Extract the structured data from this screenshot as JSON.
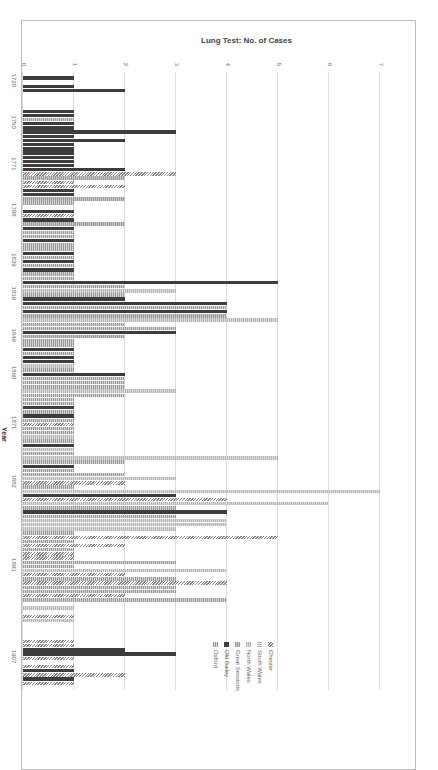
{
  "chart_data": {
    "type": "bar",
    "orientation_on_page": "rotated 90deg clockwise",
    "title": "",
    "xlabel": "Year",
    "ylabel": "Lung Test: No. of Cases",
    "ylim": [
      0,
      7
    ],
    "yticks": [
      0,
      1,
      2,
      3,
      4,
      5,
      6,
      7
    ],
    "grid": true,
    "legend_position": "top-right (rotated)",
    "xtick_labels": [
      "1720",
      "1750",
      "1771",
      "1798",
      "1829",
      "1839",
      "1849",
      "1860",
      "1871",
      "1882",
      "1893",
      "1907"
    ],
    "series_names": [
      "Chester",
      "South Wales",
      "North Wales",
      "Great Sessions",
      "Old Bailey",
      "Oxford"
    ],
    "series_styles": [
      "diagonal-hatch",
      "light-vertical",
      "light-dotted",
      "gray-dotted",
      "solid-dark",
      "gray-dotted-light"
    ],
    "bars": [
      {
        "pos": 1,
        "series": 4,
        "value": 1
      },
      {
        "pos": 3,
        "series": 4,
        "value": 1
      },
      {
        "pos": 4,
        "series": 4,
        "value": 2
      },
      {
        "pos": 9,
        "series": 4,
        "value": 1
      },
      {
        "pos": 10,
        "series": 4,
        "value": 1
      },
      {
        "pos": 11,
        "series": 5,
        "value": 1
      },
      {
        "pos": 12,
        "series": 4,
        "value": 1
      },
      {
        "pos": 13,
        "series": 4,
        "value": 1
      },
      {
        "pos": 14,
        "series": 4,
        "value": 3
      },
      {
        "pos": 15,
        "series": 4,
        "value": 1
      },
      {
        "pos": 16,
        "series": 4,
        "value": 2
      },
      {
        "pos": 17,
        "series": 4,
        "value": 1
      },
      {
        "pos": 18,
        "series": 4,
        "value": 1
      },
      {
        "pos": 19,
        "series": 4,
        "value": 1
      },
      {
        "pos": 20,
        "series": 4,
        "value": 1
      },
      {
        "pos": 21,
        "series": 4,
        "value": 1
      },
      {
        "pos": 22,
        "series": 4,
        "value": 1
      },
      {
        "pos": 23,
        "series": 4,
        "value": 2
      },
      {
        "pos": 24,
        "series": 0,
        "value": 3
      },
      {
        "pos": 25,
        "series": 3,
        "value": 2
      },
      {
        "pos": 26,
        "series": 0,
        "value": 1
      },
      {
        "pos": 27,
        "series": 0,
        "value": 2
      },
      {
        "pos": 28,
        "series": 4,
        "value": 1
      },
      {
        "pos": 29,
        "series": 4,
        "value": 1
      },
      {
        "pos": 30,
        "series": 3,
        "value": 2
      },
      {
        "pos": 31,
        "series": 5,
        "value": 1
      },
      {
        "pos": 33,
        "series": 4,
        "value": 1
      },
      {
        "pos": 34,
        "series": 0,
        "value": 1
      },
      {
        "pos": 35,
        "series": 4,
        "value": 1
      },
      {
        "pos": 36,
        "series": 3,
        "value": 2
      },
      {
        "pos": 37,
        "series": 4,
        "value": 1
      },
      {
        "pos": 38,
        "series": 5,
        "value": 1
      },
      {
        "pos": 39,
        "series": 5,
        "value": 1
      },
      {
        "pos": 40,
        "series": 4,
        "value": 1
      },
      {
        "pos": 41,
        "series": 5,
        "value": 1
      },
      {
        "pos": 42,
        "series": 5,
        "value": 1
      },
      {
        "pos": 43,
        "series": 4,
        "value": 1
      },
      {
        "pos": 44,
        "series": 5,
        "value": 1
      },
      {
        "pos": 45,
        "series": 4,
        "value": 1
      },
      {
        "pos": 46,
        "series": 5,
        "value": 1
      },
      {
        "pos": 47,
        "series": 4,
        "value": 1
      },
      {
        "pos": 48,
        "series": 5,
        "value": 1
      },
      {
        "pos": 49,
        "series": 5,
        "value": 1
      },
      {
        "pos": 50,
        "series": 4,
        "value": 5
      },
      {
        "pos": 51,
        "series": 5,
        "value": 2
      },
      {
        "pos": 52,
        "series": 2,
        "value": 3
      },
      {
        "pos": 53,
        "series": 5,
        "value": 2
      },
      {
        "pos": 54,
        "series": 4,
        "value": 2
      },
      {
        "pos": 55,
        "series": 4,
        "value": 4
      },
      {
        "pos": 56,
        "series": 5,
        "value": 4
      },
      {
        "pos": 57,
        "series": 4,
        "value": 4
      },
      {
        "pos": 58,
        "series": 3,
        "value": 4
      },
      {
        "pos": 59,
        "series": 2,
        "value": 5
      },
      {
        "pos": 60,
        "series": 5,
        "value": 2
      },
      {
        "pos": 61,
        "series": 5,
        "value": 3
      },
      {
        "pos": 62,
        "series": 4,
        "value": 3
      },
      {
        "pos": 63,
        "series": 3,
        "value": 2
      },
      {
        "pos": 64,
        "series": 5,
        "value": 1
      },
      {
        "pos": 65,
        "series": 5,
        "value": 1
      },
      {
        "pos": 66,
        "series": 4,
        "value": 1
      },
      {
        "pos": 67,
        "series": 5,
        "value": 1
      },
      {
        "pos": 68,
        "series": 4,
        "value": 1
      },
      {
        "pos": 69,
        "series": 4,
        "value": 1
      },
      {
        "pos": 70,
        "series": 2,
        "value": 1
      },
      {
        "pos": 71,
        "series": 5,
        "value": 1
      },
      {
        "pos": 72,
        "series": 4,
        "value": 2
      },
      {
        "pos": 73,
        "series": 5,
        "value": 2
      },
      {
        "pos": 74,
        "series": 5,
        "value": 2
      },
      {
        "pos": 75,
        "series": 5,
        "value": 2
      },
      {
        "pos": 76,
        "series": 2,
        "value": 3
      },
      {
        "pos": 77,
        "series": 5,
        "value": 2
      },
      {
        "pos": 78,
        "series": 5,
        "value": 1
      },
      {
        "pos": 79,
        "series": 5,
        "value": 1
      },
      {
        "pos": 80,
        "series": 4,
        "value": 1
      },
      {
        "pos": 81,
        "series": 5,
        "value": 1
      },
      {
        "pos": 82,
        "series": 4,
        "value": 1
      },
      {
        "pos": 83,
        "series": 5,
        "value": 1
      },
      {
        "pos": 84,
        "series": 0,
        "value": 1
      },
      {
        "pos": 85,
        "series": 5,
        "value": 1
      },
      {
        "pos": 86,
        "series": 5,
        "value": 1
      },
      {
        "pos": 87,
        "series": 2,
        "value": 1
      },
      {
        "pos": 88,
        "series": 5,
        "value": 1
      },
      {
        "pos": 89,
        "series": 4,
        "value": 1
      },
      {
        "pos": 90,
        "series": 2,
        "value": 1
      },
      {
        "pos": 91,
        "series": 5,
        "value": 1
      },
      {
        "pos": 92,
        "series": 2,
        "value": 5
      },
      {
        "pos": 93,
        "series": 5,
        "value": 2
      },
      {
        "pos": 94,
        "series": 4,
        "value": 1
      },
      {
        "pos": 95,
        "series": 5,
        "value": 1
      },
      {
        "pos": 96,
        "series": 5,
        "value": 2
      },
      {
        "pos": 97,
        "series": 2,
        "value": 3
      },
      {
        "pos": 98,
        "series": 0,
        "value": 2
      },
      {
        "pos": 99,
        "series": 5,
        "value": 1
      },
      {
        "pos": 100,
        "series": 2,
        "value": 7
      },
      {
        "pos": 101,
        "series": 4,
        "value": 3
      },
      {
        "pos": 102,
        "series": 0,
        "value": 4
      },
      {
        "pos": 103,
        "series": 2,
        "value": 6
      },
      {
        "pos": 104,
        "series": 5,
        "value": 3
      },
      {
        "pos": 105,
        "series": 4,
        "value": 4
      },
      {
        "pos": 106,
        "series": 5,
        "value": 3
      },
      {
        "pos": 107,
        "series": 2,
        "value": 4
      },
      {
        "pos": 108,
        "series": 2,
        "value": 4
      },
      {
        "pos": 109,
        "series": 2,
        "value": 3
      },
      {
        "pos": 110,
        "series": 5,
        "value": 1
      },
      {
        "pos": 111,
        "series": 0,
        "value": 5
      },
      {
        "pos": 112,
        "series": 5,
        "value": 1
      },
      {
        "pos": 113,
        "series": 0,
        "value": 2
      },
      {
        "pos": 114,
        "series": 5,
        "value": 1
      },
      {
        "pos": 115,
        "series": 0,
        "value": 1
      },
      {
        "pos": 116,
        "series": 0,
        "value": 1
      },
      {
        "pos": 117,
        "series": 5,
        "value": 3
      },
      {
        "pos": 118,
        "series": 5,
        "value": 1
      },
      {
        "pos": 119,
        "series": 2,
        "value": 4
      },
      {
        "pos": 120,
        "series": 0,
        "value": 2
      },
      {
        "pos": 121,
        "series": 5,
        "value": 3
      },
      {
        "pos": 122,
        "series": 0,
        "value": 4
      },
      {
        "pos": 123,
        "series": 5,
        "value": 3
      },
      {
        "pos": 124,
        "series": 5,
        "value": 3
      },
      {
        "pos": 125,
        "series": 0,
        "value": 2
      },
      {
        "pos": 126,
        "series": 5,
        "value": 4
      },
      {
        "pos": 128,
        "series": 2,
        "value": 1
      },
      {
        "pos": 130,
        "series": 0,
        "value": 1
      },
      {
        "pos": 131,
        "series": 2,
        "value": 1
      },
      {
        "pos": 136,
        "series": 0,
        "value": 1
      },
      {
        "pos": 137,
        "series": 0,
        "value": 1
      },
      {
        "pos": 138,
        "series": 4,
        "value": 2
      },
      {
        "pos": 139,
        "series": 4,
        "value": 3
      },
      {
        "pos": 140,
        "series": 0,
        "value": 1
      },
      {
        "pos": 142,
        "series": 0,
        "value": 1
      },
      {
        "pos": 143,
        "series": 4,
        "value": 1
      },
      {
        "pos": 144,
        "series": 0,
        "value": 2
      },
      {
        "pos": 145,
        "series": 4,
        "value": 1
      },
      {
        "pos": 146,
        "series": 0,
        "value": 1
      }
    ]
  },
  "legend": {
    "items": [
      {
        "label": "Chester",
        "marker": "diagonal-hatch"
      },
      {
        "label": "South Wales",
        "marker": "light-vertical"
      },
      {
        "label": "North Wales",
        "marker": "light-dotted"
      },
      {
        "label": "Great Sessions",
        "marker": "gray-dotted"
      },
      {
        "label": "Old Bailey",
        "marker": "solid-dark"
      },
      {
        "label": "Oxford",
        "marker": "gray-dotted-light"
      }
    ]
  },
  "axes": {
    "ylabel": "Lung Test: No. of Cases",
    "xlabel": "Year",
    "yticks": [
      "0",
      "1",
      "2",
      "3",
      "4",
      "5",
      "6",
      "7"
    ],
    "xticks": [
      "1720",
      "1750",
      "1771",
      "1798",
      "1829",
      "1839",
      "1849",
      "1860",
      "1871",
      "1882",
      "1893",
      "1907"
    ]
  },
  "caption": "Figure 14.1  Calculated ... lung test in 1720–1907"
}
